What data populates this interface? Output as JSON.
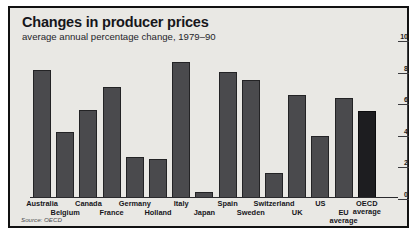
{
  "chart_data": {
    "type": "bar",
    "title": "Changes in producer prices",
    "subtitle": "average annual percentage change, 1979–90",
    "source": "Source: OECD",
    "xlabel": "",
    "ylabel": "",
    "ylim": [
      0,
      10
    ],
    "yticks": [
      0,
      2,
      4,
      6,
      8,
      10
    ],
    "ytick_labels": [
      "0",
      "2",
      "4",
      "6",
      "8",
      "10"
    ],
    "axis_position": "right",
    "grid": false,
    "legend": "none",
    "categories": [
      "Australia",
      "Belgium",
      "Canada",
      "France",
      "Germany",
      "Holland",
      "Italy",
      "Japan",
      "Spain",
      "Sweden",
      "Switzerland",
      "UK",
      "US",
      "EU average",
      "OECD average"
    ],
    "category_label_lines": [
      [
        "Australia"
      ],
      [
        "Belgium"
      ],
      [
        "Canada"
      ],
      [
        "France"
      ],
      [
        "Germany"
      ],
      [
        "Holland"
      ],
      [
        "Italy"
      ],
      [
        "Japan"
      ],
      [
        "Spain"
      ],
      [
        "Sweden"
      ],
      [
        "Switzerland"
      ],
      [
        "UK"
      ],
      [
        "US"
      ],
      [
        "EU",
        "average"
      ],
      [
        "OECD",
        "average"
      ]
    ],
    "category_label_row": [
      0,
      1,
      0,
      1,
      0,
      1,
      0,
      1,
      0,
      1,
      0,
      1,
      0,
      1,
      0
    ],
    "values": [
      8.1,
      4.2,
      5.6,
      7.0,
      2.6,
      2.5,
      8.6,
      0.4,
      8.0,
      7.5,
      1.6,
      6.5,
      3.9,
      6.3,
      5.5
    ],
    "highlight_index": 14,
    "colors": {
      "bar": "#4a4a4d",
      "bar_accent": "#1d1d20",
      "panel_background": "#e9e8e4",
      "frame": "#111111",
      "text": "#16161b"
    }
  }
}
